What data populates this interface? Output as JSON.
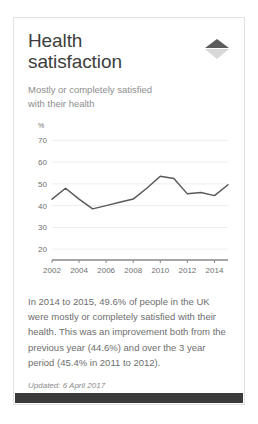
{
  "card": {
    "title": "Health\nsatisfaction",
    "subtitle": "Mostly or completely satisfied\nwith their health",
    "collapse_icon": "collapse-arrow-icon",
    "summary": "In 2014 to 2015, 49.6% of people in the UK were mostly or completely satisfied with their health. This was an improvement both from the previous year (44.6%) and over the 3 year period (45.4% in 2011 to 2012).",
    "updated": "Updated: 6 April 2017"
  },
  "colors": {
    "line": "#595959",
    "axis": "#888888",
    "grid": "#ececec",
    "title": "#3d3d3d",
    "muted": "#8e8e8e",
    "body": "#6e6e6e",
    "bottom_bar": "#3a3a3a",
    "card_border": "#e2e2e2"
  },
  "chart_data": {
    "type": "line",
    "title": "",
    "xlabel": "",
    "ylabel": "%",
    "ylim": [
      15,
      72
    ],
    "xlim": [
      2002,
      2015
    ],
    "grid": true,
    "legend": "none",
    "ytick_labels": [
      "70",
      "60",
      "50",
      "40",
      "30",
      "20"
    ],
    "yticks": [
      70,
      60,
      50,
      40,
      30,
      20
    ],
    "xtick_labels": [
      "2002",
      "2004",
      "2006",
      "2008",
      "2010",
      "2012",
      "2014"
    ],
    "xticks": [
      2002,
      2004,
      2006,
      2008,
      2010,
      2012,
      2014
    ],
    "x": [
      2002,
      2003,
      2004,
      2005,
      2006,
      2007,
      2008,
      2009,
      2010,
      2011,
      2012,
      2013,
      2014,
      2015
    ],
    "values": [
      43.0,
      48.0,
      43.0,
      38.5,
      40.0,
      41.5,
      43.0,
      48.0,
      53.5,
      52.5,
      45.4,
      46.0,
      44.6,
      49.6
    ]
  }
}
